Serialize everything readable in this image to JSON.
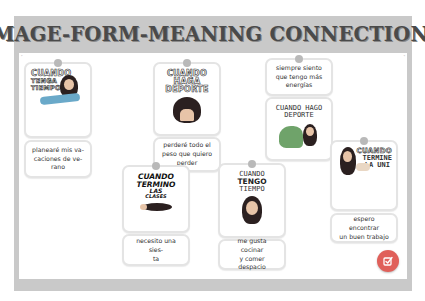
{
  "header": {
    "title": "IMAGE-FORM-MEANING CONNECTIONS"
  },
  "colors": {
    "frame": "#c9c9c9",
    "title_text": "#4a4a4a",
    "panel": "#ffffff",
    "card_border": "#e4e4e4",
    "pin": "#b9b9b9",
    "check_button": "#e0605a"
  },
  "cards": [
    {
      "id": "tenga-tiempo",
      "image_caption": [
        "CUANDO",
        "TENGA",
        "TIEMPO"
      ],
      "image_icon": "woman-on-beach-chair-sticker",
      "meaning_text": "planearé mis vacaciones de verano",
      "meaning_lines": [
        "planearé mis va-",
        "caciones de ve-",
        "rano"
      ]
    },
    {
      "id": "haga-deporte",
      "image_caption": [
        "CUANDO",
        "HAGA",
        "DEPORTE"
      ],
      "image_icon": "woman-head-peeking-sticker",
      "meaning_text": "perderé todo el peso que quiero perder",
      "meaning_lines": [
        "perderé todo el",
        "peso que quiero",
        "perder"
      ]
    },
    {
      "id": "hago-deporte",
      "image_caption": [
        "CUANDO HAGO",
        "DEPORTE"
      ],
      "image_icon": "dinosaur-and-woman-sticker",
      "meaning_text": "siempre siento que tengo más energías",
      "meaning_lines": [
        "siempre siento",
        "que tengo más",
        "energías"
      ]
    },
    {
      "id": "termino-las-clases",
      "image_caption": [
        "CUANDO",
        "TERMINO",
        "LAS",
        "CLASES"
      ],
      "image_icon": "woman-lying-down-sticker",
      "meaning_text": "necesito una siesta",
      "meaning_lines": [
        "necesito una sies-",
        "ta"
      ]
    },
    {
      "id": "tengo-tiempo",
      "image_caption": [
        "CUANDO",
        "TENGO",
        "TIEMPO"
      ],
      "image_icon": "woman-portrait-sparkles-sticker",
      "meaning_text": "me gusta cocinar y comer despacio",
      "meaning_lines": [
        "me gusta cocinar",
        "y comer despacio"
      ]
    },
    {
      "id": "termine-la-uni",
      "image_caption": [
        "CUANDO",
        "TERMINE",
        "LA UNI"
      ],
      "image_icon": "woman-celebrating-sticker",
      "meaning_text": "espero encontrar un buen trabajo",
      "meaning_lines": [
        "espero encontrar",
        "un buen trabajo"
      ]
    }
  ],
  "controls": {
    "check_button_icon": "check-square-icon",
    "check_button_label": "Check"
  }
}
